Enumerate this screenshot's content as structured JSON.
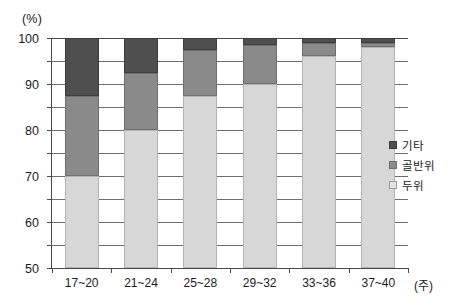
{
  "chart_data": {
    "type": "bar",
    "subtype": "stacked-bar-100",
    "title": "",
    "xlabel": "(주)",
    "ylabel": "(%)",
    "ylim": [
      0,
      100
    ],
    "ytick_step": 10,
    "grid": true,
    "legend_position": "right",
    "categories": [
      "17~20",
      "21~24",
      "25~28",
      "29~32",
      "33~36",
      "37~40"
    ],
    "series": [
      {
        "name": "두위",
        "color": "#d7d7d7",
        "values": [
          40,
          60,
          75,
          80,
          92,
          96
        ]
      },
      {
        "name": "골반위",
        "color": "#8a8a8a",
        "values": [
          35,
          25,
          20,
          17,
          6,
          2
        ]
      },
      {
        "name": "기타",
        "color": "#4f4f4f",
        "values": [
          25,
          15,
          5,
          3,
          2,
          2
        ]
      }
    ],
    "stack_order_bottom_to_top": [
      "두위",
      "골반위",
      "기타"
    ],
    "ytick_labels": [
      "0",
      "10",
      "20",
      "30",
      "40",
      "50",
      "60",
      "70",
      "80",
      "90",
      "100"
    ],
    "xtick_labels": [
      "17~20",
      "21~24",
      "25~28",
      "29~32",
      "33~36",
      "37~40"
    ]
  },
  "axes": {
    "y_unit": "(%)",
    "x_unit": "(주)"
  },
  "legend": {
    "items": [
      {
        "label": "기타",
        "swatch": "dark-gray-swatch-icon"
      },
      {
        "label": "골반위",
        "swatch": "mid-gray-swatch-icon"
      },
      {
        "label": "두위",
        "swatch": "light-gray-swatch-icon"
      }
    ]
  }
}
